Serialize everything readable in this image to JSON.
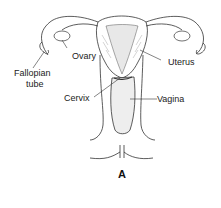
{
  "diagram": {
    "caption": "A",
    "labels": {
      "ovary": "Ovary",
      "fallopian_tube_line1": "Fallopian",
      "fallopian_tube_line2": "tube",
      "uterus": "Uterus",
      "cervix": "Cervix",
      "vagina": "Vagina"
    },
    "colors": {
      "line": "#333333",
      "shading": "#bbbbbb",
      "background": "#ffffff"
    }
  }
}
